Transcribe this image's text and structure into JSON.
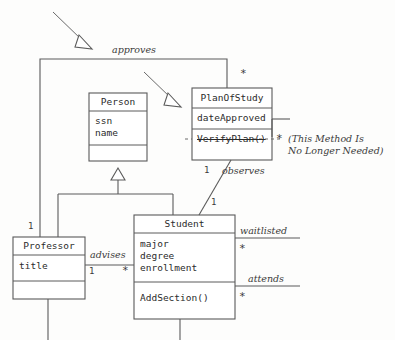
{
  "diagram": {
    "kind": "uml-class-diagram",
    "stroke_color": "#4a4a4a",
    "text_color": "#2b2b2b",
    "background": "#fdfdfc"
  },
  "classes": {
    "person": {
      "name": "Person",
      "attributes": [
        "ssn",
        "name"
      ],
      "operations": []
    },
    "plan_of_study": {
      "name": "PlanOfStudy",
      "attributes": [
        "dateApproved"
      ],
      "operations": [
        "VerifyPlan()"
      ],
      "operation_struck": true
    },
    "professor": {
      "name": "Professor",
      "attributes": [
        "title"
      ],
      "operations": []
    },
    "student": {
      "name": "Student",
      "attributes": [
        "major",
        "degree",
        "enrollment"
      ],
      "operations": [
        "AddSection()"
      ]
    }
  },
  "associations": {
    "approves": {
      "label": "approves",
      "source_multiplicity": "1",
      "target_multiplicity": "*"
    },
    "observes": {
      "label": "observes",
      "source_multiplicity": "1",
      "target_multiplicity": "1"
    },
    "advises": {
      "label": "advises",
      "source_multiplicity": "1",
      "target_multiplicity": "*"
    },
    "waitlisted": {
      "label": "waitlisted",
      "multiplicity": "*"
    },
    "attends": {
      "label": "attends",
      "multiplicity": "*"
    },
    "plan_note_multiplicity": "*"
  },
  "annotation": {
    "line1": "(This Method Is",
    "line2": "No Longer Needed)"
  }
}
